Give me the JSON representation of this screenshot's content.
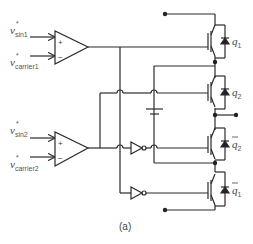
{
  "figure": {
    "caption": "(a)",
    "comparators": [
      {
        "input_plus": {
          "symbol": "v",
          "sub": "sin1",
          "sup": "*"
        },
        "input_minus": {
          "symbol": "v",
          "sub": "carrier1",
          "sup": "*"
        },
        "plus_sign": "+",
        "minus_sign": "−"
      },
      {
        "input_plus": {
          "symbol": "v",
          "sub": "sin2",
          "sup": "*"
        },
        "input_minus": {
          "symbol": "v",
          "sub": "carrier2",
          "sup": "*"
        },
        "plus_sign": "+",
        "minus_sign": "−"
      }
    ],
    "switches": [
      {
        "label": "q",
        "sub": "1",
        "bar": false
      },
      {
        "label": "q",
        "sub": "2",
        "bar": false
      },
      {
        "label": "q",
        "sub": "2",
        "bar": true
      },
      {
        "label": "q",
        "sub": "1",
        "bar": true
      }
    ],
    "components": [
      "comparator",
      "comparator",
      "inverter",
      "inverter",
      "IGBT",
      "IGBT",
      "IGBT",
      "IGBT",
      "diode",
      "capacitor"
    ]
  }
}
